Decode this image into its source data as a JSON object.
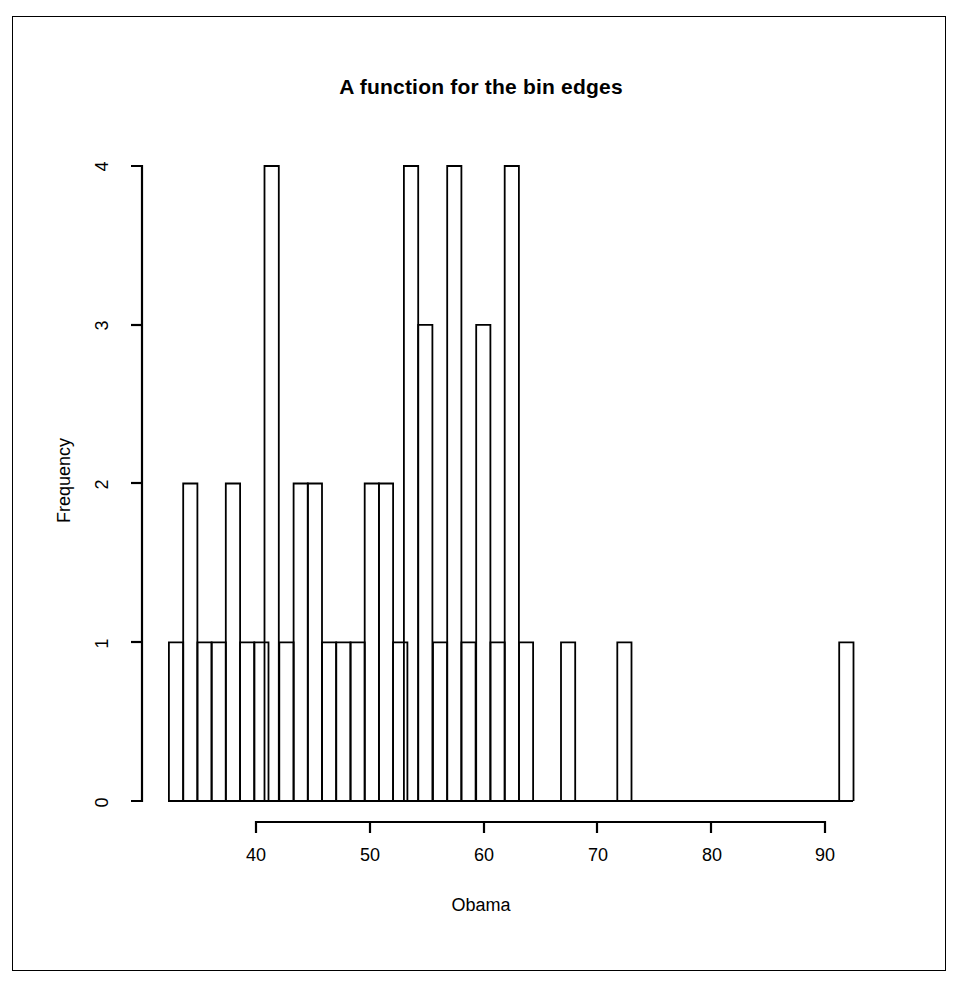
{
  "chart_data": {
    "type": "bar",
    "title": "A function for the bin edges",
    "xlabel": "Obama",
    "ylabel": "Frequency",
    "grid": false,
    "legend": null,
    "xlim": [
      32.3,
      92.5
    ],
    "ylim": [
      0,
      4
    ],
    "xticks": [
      40,
      50,
      60,
      70,
      80,
      90
    ],
    "yticks": [
      0,
      1,
      2,
      3,
      4
    ],
    "bin_width": 1.25,
    "bin_starts": [
      32.35,
      33.6,
      34.85,
      36.1,
      37.35,
      38.6,
      39.85,
      40.75,
      42.05,
      43.3,
      44.55,
      45.8,
      47.05,
      48.3,
      49.55,
      50.8,
      52.05,
      53.0,
      54.25,
      55.55,
      56.8,
      58.05,
      59.35,
      60.6,
      61.85,
      63.1,
      66.8,
      71.75,
      91.25
    ],
    "categories": [
      "32.4",
      "33.6",
      "34.9",
      "36.1",
      "37.4",
      "38.6",
      "39.9",
      "40.8",
      "42.1",
      "43.3",
      "44.6",
      "45.8",
      "47.1",
      "48.3",
      "49.6",
      "50.8",
      "52.1",
      "53.0",
      "54.3",
      "55.6",
      "56.8",
      "58.1",
      "59.4",
      "60.6",
      "61.9",
      "63.1",
      "66.8",
      "71.8",
      "91.3"
    ],
    "values": [
      1,
      2,
      1,
      1,
      2,
      1,
      1,
      4,
      1,
      2,
      2,
      1,
      1,
      1,
      2,
      2,
      1,
      4,
      3,
      1,
      4,
      1,
      3,
      1,
      4,
      1,
      1,
      1,
      1
    ]
  },
  "chart_text": {
    "title": "A function for the bin edges",
    "xlabel": "Obama",
    "ylabel": "Frequency",
    "xticks": [
      "40",
      "50",
      "60",
      "70",
      "80",
      "90"
    ],
    "yticks": [
      "0",
      "1",
      "2",
      "3",
      "4"
    ]
  }
}
